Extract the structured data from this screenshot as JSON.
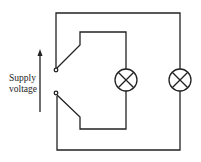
{
  "diagram": {
    "type": "circuit",
    "label_line1": "Supply",
    "label_line2": "voltage",
    "components": [
      {
        "id": "switch",
        "kind": "two-way switch terminals"
      },
      {
        "id": "lamp1",
        "kind": "lamp",
        "symbol": "circle-cross"
      },
      {
        "id": "lamp2",
        "kind": "lamp",
        "symbol": "circle-cross"
      },
      {
        "id": "supply-arrow",
        "kind": "arrow",
        "direction": "up"
      }
    ],
    "colors": {
      "stroke": "#222222",
      "background": "#ffffff"
    }
  }
}
